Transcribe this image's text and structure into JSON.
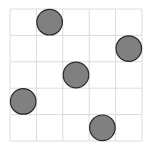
{
  "grid": {
    "rows": 5,
    "cols": 5,
    "origin_x": 10,
    "origin_y": 9,
    "cell_size": 26.4,
    "line_color": "#dcdcdc"
  },
  "pieces": [
    {
      "row": 0,
      "col": 1,
      "color": "#808080",
      "stroke": "#2a2a2a"
    },
    {
      "row": 1,
      "col": 4,
      "color": "#808080",
      "stroke": "#2a2a2a"
    },
    {
      "row": 2,
      "col": 2,
      "color": "#808080",
      "stroke": "#2a2a2a"
    },
    {
      "row": 3,
      "col": 0,
      "color": "#808080",
      "stroke": "#2a2a2a"
    },
    {
      "row": 4,
      "col": 3,
      "color": "#808080",
      "stroke": "#2a2a2a"
    }
  ],
  "piece_radius": 12.8
}
